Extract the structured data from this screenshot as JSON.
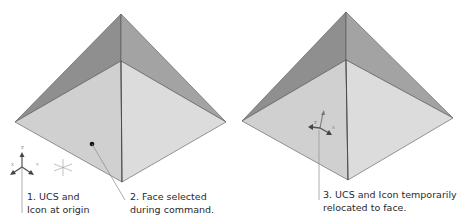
{
  "figure": {
    "colors": {
      "face_dark": "#8f8f8f",
      "face_mid": "#9e9e9e",
      "face_light": "#d2d2d2",
      "face_lighter": "#dedede",
      "edge": "#555555",
      "leader": "#888888",
      "text": "#2a2a2a"
    },
    "pyramids": [
      {
        "name": "left",
        "apex": [
          121,
          14
        ],
        "center": [
          121,
          61
        ],
        "left": [
          15,
          122
        ],
        "right": [
          226,
          122
        ],
        "bottom": [
          122,
          182
        ]
      },
      {
        "name": "right",
        "apex": [
          346,
          12
        ],
        "center": [
          346,
          60
        ],
        "left": [
          242,
          121
        ],
        "right": [
          453,
          118
        ],
        "bottom": [
          348,
          180
        ]
      }
    ],
    "callouts": [
      {
        "id": "1",
        "lines": [
          "1. UCS and",
          "Icon at origin"
        ]
      },
      {
        "id": "2",
        "lines": [
          "2. Face selected",
          "during command."
        ]
      },
      {
        "id": "3",
        "lines": [
          "3. UCS and Icon temporarily",
          "relocated to face."
        ]
      }
    ],
    "ucs_icon": {
      "axis_labels": {
        "z": "Z",
        "x": "X",
        "y": "Y"
      }
    }
  }
}
